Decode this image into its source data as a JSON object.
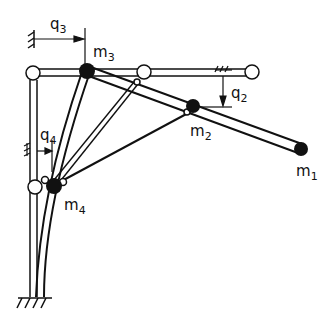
{
  "diagram": {
    "type": "mechanism-schematic",
    "masses": [
      {
        "id": "m1",
        "base": "m",
        "sub": "1"
      },
      {
        "id": "m2",
        "base": "m",
        "sub": "2"
      },
      {
        "id": "m3",
        "base": "m",
        "sub": "3"
      },
      {
        "id": "m4",
        "base": "m",
        "sub": "4"
      }
    ],
    "coordinates": [
      {
        "id": "q2",
        "base": "q",
        "sub": "2"
      },
      {
        "id": "q3",
        "base": "q",
        "sub": "3"
      },
      {
        "id": "q4",
        "base": "q",
        "sub": "4"
      }
    ],
    "colors": {
      "stroke": "#111111",
      "background": "#ffffff"
    }
  }
}
